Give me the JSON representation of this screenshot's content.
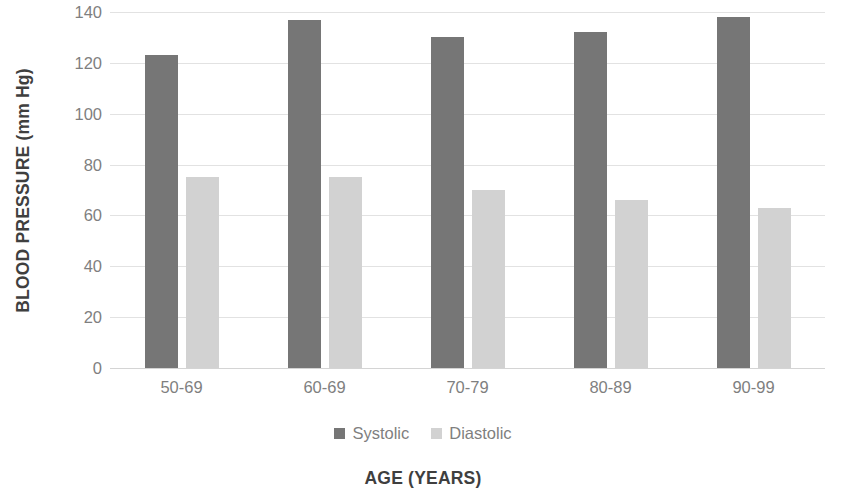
{
  "chart_data": {
    "type": "bar",
    "title": "",
    "xlabel": "AGE (YEARS)",
    "ylabel": "BLOOD PRESSURE (mm Hg)",
    "categories": [
      "50-69",
      "60-69",
      "70-79",
      "80-89",
      "90-99"
    ],
    "series": [
      {
        "name": "Systolic",
        "color": "#767676",
        "values": [
          123,
          137,
          130,
          132,
          138
        ]
      },
      {
        "name": "Diastolic",
        "color": "#d2d2d2",
        "values": [
          75,
          75,
          70,
          66,
          63
        ]
      }
    ],
    "ylim": [
      0,
      140
    ],
    "ytick_step": 20,
    "yticks": [
      140,
      120,
      100,
      80,
      60,
      40,
      20,
      0
    ],
    "grid": true,
    "grid_axis": "y",
    "legend_position": "bottom",
    "background": "#ffffff",
    "grid_color": "#e2e2e2",
    "tick_label_color": "#7f7f7f",
    "axis_title_color": "#3f3f3f"
  }
}
